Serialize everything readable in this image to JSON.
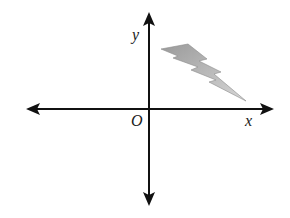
{
  "diagram": {
    "axes": {
      "x_label": "x",
      "y_label": "y",
      "origin_label": "O"
    },
    "shape": {
      "name": "lightning bolt",
      "quadrant": "I",
      "fill_gradient": [
        "#9a9a9a",
        "#d4d4d4"
      ]
    }
  }
}
